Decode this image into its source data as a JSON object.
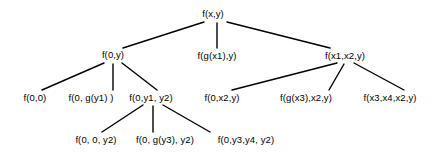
{
  "diagram": {
    "background_color": "#ffffff",
    "text_color": "#000000",
    "edge_color": "#000000",
    "nodes": [
      {
        "id": "n0",
        "label": "f(x,y)",
        "x": 213,
        "y": 14,
        "level": 0
      },
      {
        "id": "n1",
        "label": "f(0,y)",
        "x": 113,
        "y": 55,
        "level": 1
      },
      {
        "id": "n2",
        "label": "f(g(x1),y)",
        "x": 217,
        "y": 56,
        "level": 1
      },
      {
        "id": "n3",
        "label": "f(x1,x2,y)",
        "x": 345,
        "y": 56,
        "level": 1
      },
      {
        "id": "n4",
        "label": "f(0,0)",
        "x": 35,
        "y": 98,
        "level": 2
      },
      {
        "id": "n5",
        "label": "f(0, g(y1) )",
        "x": 91,
        "y": 98,
        "level": 2
      },
      {
        "id": "n6",
        "label": "f(0,y1, y2)",
        "x": 151,
        "y": 98,
        "level": 2
      },
      {
        "id": "n7",
        "label": "f(0,x2,y)",
        "x": 222,
        "y": 98,
        "level": 2
      },
      {
        "id": "n8",
        "label": "f(g(x3),x2,y)",
        "x": 306,
        "y": 98,
        "level": 2
      },
      {
        "id": "n9",
        "label": "f(x3,x4,x2,y)",
        "x": 390,
        "y": 98,
        "level": 2
      },
      {
        "id": "n10",
        "label": "f(0, 0, y2)",
        "x": 96,
        "y": 140,
        "level": 3
      },
      {
        "id": "n11",
        "label": "f(0, g(y3), y2)",
        "x": 165,
        "y": 140,
        "level": 3
      },
      {
        "id": "n12",
        "label": "f(0,y3,y4, y2)",
        "x": 246,
        "y": 140,
        "level": 3
      }
    ],
    "edges": [
      {
        "from": "n0",
        "to": "n1",
        "x1": 204,
        "y1": 22,
        "x2": 123,
        "y2": 48
      },
      {
        "from": "n0",
        "to": "n2",
        "x1": 217,
        "y1": 23,
        "x2": 217,
        "y2": 48
      },
      {
        "from": "n0",
        "to": "n3",
        "x1": 227,
        "y1": 22,
        "x2": 330,
        "y2": 48
      },
      {
        "from": "n1",
        "to": "n4",
        "x1": 104,
        "y1": 63,
        "x2": 42,
        "y2": 90
      },
      {
        "from": "n1",
        "to": "n5",
        "x1": 113,
        "y1": 64,
        "x2": 113,
        "y2": 90
      },
      {
        "from": "n1",
        "to": "n6",
        "x1": 122,
        "y1": 63,
        "x2": 157,
        "y2": 90
      },
      {
        "from": "n3",
        "to": "n7",
        "x1": 337,
        "y1": 63,
        "x2": 232,
        "y2": 90
      },
      {
        "from": "n3",
        "to": "n8",
        "x1": 344,
        "y1": 64,
        "x2": 329,
        "y2": 90
      },
      {
        "from": "n3",
        "to": "n9",
        "x1": 354,
        "y1": 63,
        "x2": 404,
        "y2": 90
      },
      {
        "from": "n6",
        "to": "n10",
        "x1": 143,
        "y1": 105,
        "x2": 102,
        "y2": 132
      },
      {
        "from": "n6",
        "to": "n11",
        "x1": 153,
        "y1": 106,
        "x2": 153,
        "y2": 132
      },
      {
        "from": "n6",
        "to": "n12",
        "x1": 163,
        "y1": 105,
        "x2": 210,
        "y2": 132
      }
    ]
  }
}
